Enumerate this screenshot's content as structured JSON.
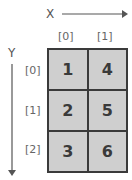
{
  "axes": {
    "x_label": "X",
    "y_label": "Y"
  },
  "column_indices": [
    "[0]",
    "[1]"
  ],
  "row_indices": [
    "[0]",
    "[1]",
    "[2]"
  ],
  "cells": [
    [
      "1",
      "4"
    ],
    [
      "2",
      "5"
    ],
    [
      "3",
      "6"
    ]
  ],
  "colors": {
    "cell_fill": "#cfcfcf",
    "border": "#3a3a3a",
    "arrow": "#555555"
  }
}
